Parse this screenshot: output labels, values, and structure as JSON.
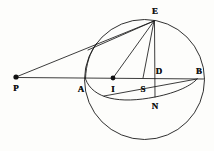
{
  "figure": {
    "kind": "geometry-diagram",
    "caption": "",
    "canvas": {
      "width": 214,
      "height": 151
    },
    "stroke_color": "#1a1a1a",
    "label_color": "#141414",
    "background_color": "#fdfdfb"
  },
  "points": [
    {
      "id": "P",
      "label": "P",
      "x": 16,
      "y": 77,
      "label_x": 16,
      "label_y": 88,
      "dot": true,
      "dot_r": 2.6
    },
    {
      "id": "A",
      "label": "A",
      "x": 81,
      "y": 78,
      "label_x": 81,
      "label_y": 89,
      "dot": false,
      "dot_r": 0
    },
    {
      "id": "I",
      "label": "I",
      "x": 113,
      "y": 78,
      "label_x": 113,
      "label_y": 89,
      "dot": true,
      "dot_r": 2.4
    },
    {
      "id": "S",
      "label": "S",
      "x": 143,
      "y": 78,
      "label_x": 143,
      "label_y": 89,
      "dot": false,
      "dot_r": 0
    },
    {
      "id": "D",
      "label": "D",
      "x": 155,
      "y": 78,
      "label_x": 159,
      "label_y": 71,
      "dot": false,
      "dot_r": 0
    },
    {
      "id": "B",
      "label": "B",
      "x": 197,
      "y": 78,
      "label_x": 199,
      "label_y": 71,
      "dot": false,
      "dot_r": 0
    },
    {
      "id": "E",
      "label": "E",
      "x": 154,
      "y": 21,
      "label_x": 155,
      "label_y": 11,
      "dot": false,
      "dot_r": 0
    },
    {
      "id": "N",
      "label": "N",
      "x": 155,
      "y": 97,
      "label_x": 155,
      "label_y": 106,
      "dot": false,
      "dot_r": 0
    }
  ],
  "circles": [
    {
      "id": "main-circle",
      "cx": 144.5,
      "cy": 79.5,
      "r": 60.0
    }
  ],
  "arcs": [
    {
      "id": "inner-ellipse-arc",
      "path": "M 85.5 79 C 93 99 120 104 155 97 C 178 92.5 192 85 197.5 78.5"
    },
    {
      "id": "left-inner-arc",
      "path": "M 85.5 79 C 86 64 90 52 97 43"
    }
  ],
  "segments": [
    {
      "id": "PB-axis",
      "x1": 16,
      "y1": 77.5,
      "x2": 204,
      "y2": 79
    },
    {
      "id": "PE",
      "x1": 16,
      "y1": 77,
      "x2": 154,
      "y2": 21
    },
    {
      "id": "EI",
      "x1": 154,
      "y1": 21,
      "x2": 113,
      "y2": 78
    },
    {
      "id": "ES",
      "x1": 154,
      "y1": 21,
      "x2": 143,
      "y2": 78
    },
    {
      "id": "EN",
      "x1": 154.5,
      "y1": 21,
      "x2": 155,
      "y2": 97
    },
    {
      "id": "E-chord",
      "x1": 154,
      "y1": 21,
      "x2": 88,
      "y2": 50
    },
    {
      "id": "B-chord",
      "x1": 197,
      "y1": 79,
      "x2": 104,
      "y2": 96
    }
  ]
}
